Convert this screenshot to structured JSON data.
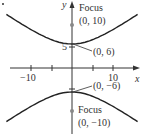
{
  "chart_data": {
    "type": "line",
    "title": "",
    "xlabel": "x",
    "ylabel": "y",
    "xlim": [
      -14,
      14
    ],
    "ylim": [
      -14,
      14
    ],
    "grid": false,
    "x_ticks": [
      -10,
      -5,
      5,
      10
    ],
    "x_tick_labels": [
      "−10",
      "10"
    ],
    "y_ticks": [
      5
    ],
    "y_tick_labels": [
      "5"
    ],
    "series": [
      {
        "name": "upper branch",
        "equation": "y = 6*sqrt(1 + x^2/64)"
      },
      {
        "name": "lower branch",
        "equation": "y = -6*sqrt(1 + x^2/64)"
      }
    ],
    "points": [
      {
        "label": "Focus (0, 10)",
        "x": 0,
        "y": 10,
        "type": "focus"
      },
      {
        "label": "(0, 6)",
        "x": 0,
        "y": 6,
        "type": "vertex"
      },
      {
        "label": "(0, −6)",
        "x": 0,
        "y": -6,
        "type": "vertex"
      },
      {
        "label": "Focus (0, −10)",
        "x": 0,
        "y": -10,
        "type": "focus"
      }
    ]
  },
  "labels": {
    "y_axis": "y",
    "x_axis": "x",
    "tick_neg10": "−10",
    "tick_pos10": "10",
    "tick_5": "5",
    "focus_top_word": "Focus",
    "focus_top_coord": "(0, 10)",
    "vertex_top": "(0, 6)",
    "vertex_bottom": "(0, −6)",
    "focus_bottom_word": "Focus",
    "focus_bottom_coord": "(0, −10)"
  },
  "colors": {
    "curve": "#222222",
    "axis": "#333333",
    "focus": "#888888"
  }
}
